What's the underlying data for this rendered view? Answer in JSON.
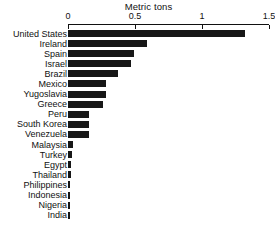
{
  "chart_data": {
    "type": "bar",
    "orientation": "horizontal",
    "title": "Metric tons",
    "xlabel": "",
    "ylabel": "",
    "xlim": [
      0,
      1.5
    ],
    "xticks": [
      0,
      0.5,
      1,
      1.5
    ],
    "xtick_labels": [
      "0",
      "0.5",
      "1",
      "1.5"
    ],
    "grid": false,
    "legend": false,
    "bar_color": "#171717",
    "categories": [
      "United States",
      "Ireland",
      "Spain",
      "Israel",
      "Brazil",
      "Mexico",
      "Yugoslavia",
      "Greece",
      "Peru",
      "South Korea",
      "Venezuela",
      "Malaysia",
      "Turkey",
      "Egypt",
      "Thailand",
      "Philippines",
      "Indonesia",
      "Nigeria",
      "India"
    ],
    "values": [
      1.32,
      0.59,
      0.49,
      0.47,
      0.37,
      0.28,
      0.28,
      0.26,
      0.16,
      0.16,
      0.16,
      0.04,
      0.03,
      0.025,
      0.022,
      0.018,
      0.013,
      0.008,
      0.006
    ]
  }
}
